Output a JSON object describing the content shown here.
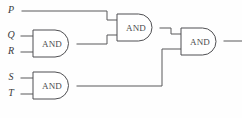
{
  "figure": {
    "kind": "logic-circuit-diagram",
    "width": 242,
    "height": 118,
    "background_color": "#fefefe",
    "wire_color": "#58585a",
    "gate_outline_color": "#4f4f52",
    "gate_fill_color": "#ffffff",
    "label_color": "#3a3a3c"
  },
  "inputs": [
    {
      "id": "P",
      "label": "P",
      "x": 11,
      "y": 11
    },
    {
      "id": "Q",
      "label": "Q",
      "x": 11,
      "y": 36
    },
    {
      "id": "R",
      "label": "R",
      "x": 11,
      "y": 52
    },
    {
      "id": "S",
      "label": "S",
      "x": 11,
      "y": 78
    },
    {
      "id": "T",
      "label": "T",
      "x": 11,
      "y": 94
    }
  ],
  "gates": [
    {
      "id": "gate-and-1",
      "label": "AND",
      "type": "AND",
      "x": 33,
      "y": 30,
      "width": 44,
      "height": 27,
      "inputs": [
        "Q",
        "R"
      ],
      "output_y": 44
    },
    {
      "id": "gate-and-2",
      "label": "AND",
      "type": "AND",
      "x": 117,
      "y": 14,
      "width": 43,
      "height": 27,
      "inputs": [
        "P",
        "gate-and-1"
      ],
      "output_y": 28
    },
    {
      "id": "gate-and-3",
      "label": "AND",
      "type": "AND",
      "x": 181,
      "y": 28,
      "width": 43,
      "height": 27,
      "inputs": [
        "gate-and-2",
        "gate-and-4"
      ],
      "output_y": 41
    },
    {
      "id": "gate-and-4",
      "label": "AND",
      "type": "AND",
      "x": 33,
      "y": 72,
      "width": 44,
      "height": 27,
      "inputs": [
        "S",
        "T"
      ],
      "output_y": 86
    }
  ],
  "output": {
    "id": "circuit-output",
    "x": 242,
    "y": 41
  }
}
